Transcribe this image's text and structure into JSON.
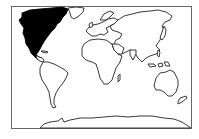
{
  "map": {
    "type": "world-outline",
    "projection": "equirectangular-like",
    "highlighted_region": "North America",
    "colors": {
      "highlight": "#000000",
      "land_fill": "#ffffff",
      "outline": "#222222",
      "background": "#ffffff",
      "frame": "#444444"
    },
    "regions": [
      {
        "name": "North America",
        "highlighted": true
      },
      {
        "name": "South America",
        "highlighted": false
      },
      {
        "name": "Europe",
        "highlighted": false
      },
      {
        "name": "Africa",
        "highlighted": false
      },
      {
        "name": "Asia",
        "highlighted": false
      },
      {
        "name": "Australia",
        "highlighted": false
      },
      {
        "name": "Antarctica",
        "highlighted": false
      },
      {
        "name": "Greenland",
        "highlighted": false
      }
    ]
  }
}
